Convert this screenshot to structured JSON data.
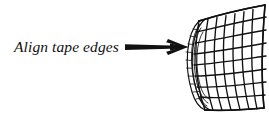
{
  "figure": {
    "kind": "instructional-line-drawing",
    "background_color": "#ffffff",
    "ink_color": "#111111",
    "width": 269,
    "height": 115
  },
  "annotation": {
    "label": "Align tape edges",
    "label_style": "italic-serif",
    "label_color": "#111111",
    "pointer": {
      "name": "arrow",
      "direction": "right",
      "color": "#111111",
      "start_x": 125,
      "end_x": 188,
      "y": 47,
      "head_style": "barbed"
    }
  },
  "object": {
    "name": "mesh-tape-sheet",
    "description": "Curved grid mesh sheet with rolled left edge",
    "color": "#111111",
    "grid_columns": 7,
    "grid_rows": 8,
    "rolled_edge_side": "left",
    "roll_turns": 3
  }
}
